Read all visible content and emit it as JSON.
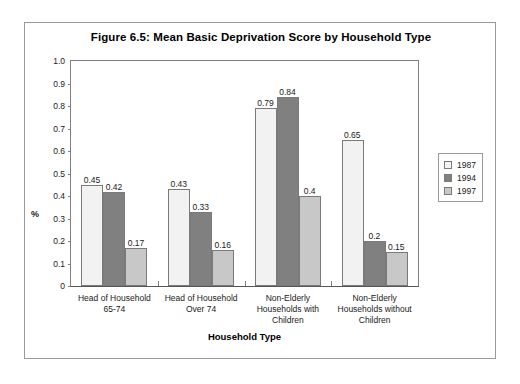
{
  "chart_data": {
    "type": "bar",
    "title": "Figure 6.5: Mean Basic Deprivation Score by Household Type",
    "xlabel": "Household Type",
    "ylabel": "%",
    "ylim": [
      0,
      1.0
    ],
    "ytick_labels": [
      "1.0",
      "0.9",
      "0.8",
      "0.7",
      "0.6",
      "0.5",
      "0.4",
      "0.3",
      "0.2",
      "0.1",
      "0"
    ],
    "ytick_values": [
      1.0,
      0.9,
      0.8,
      0.7,
      0.6,
      0.5,
      0.4,
      0.3,
      0.2,
      0.1,
      0
    ],
    "grid": false,
    "legend_position": "right",
    "categories": [
      "Head of Household 65-74",
      "Head of Household Over 74",
      "Non-Elderly Households with Children",
      "Non-Elderly Households without Children"
    ],
    "category_lines": [
      [
        "Head of Household",
        "65-74"
      ],
      [
        "Head of Household",
        "Over 74"
      ],
      [
        "Non-Elderly",
        "Households with",
        "Children"
      ],
      [
        "Non-Elderly",
        "Households without",
        "Children"
      ]
    ],
    "series": [
      {
        "name": "1987",
        "color": "#f2f2f2",
        "values": [
          0.45,
          0.43,
          0.79,
          0.65
        ],
        "labels": [
          "0.45",
          "0.43",
          "0.79",
          "0.65"
        ]
      },
      {
        "name": "1994",
        "color": "#808080",
        "values": [
          0.42,
          0.33,
          0.84,
          0.2
        ],
        "labels": [
          "0.42",
          "0.33",
          "0.84",
          "0.2"
        ]
      },
      {
        "name": "1997",
        "color": "#c8c8c8",
        "values": [
          0.17,
          0.16,
          0.4,
          0.15
        ],
        "labels": [
          "0.17",
          "0.16",
          "0.4",
          "0.15"
        ]
      }
    ]
  }
}
